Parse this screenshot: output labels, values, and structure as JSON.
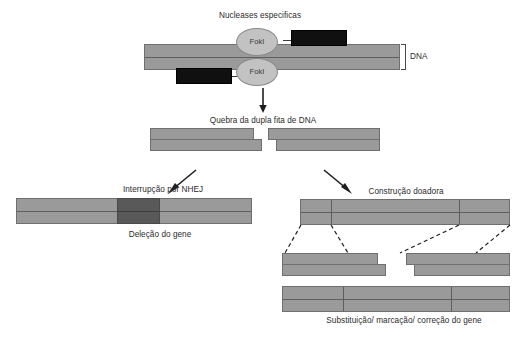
{
  "figure": {
    "title": "Nucleases especificas",
    "background_color": "#ffffff"
  },
  "labels": {
    "nucleases": "Nucleases especificas",
    "fok_top": "FokI",
    "fok_bottom": "FokI",
    "dna": "DNA",
    "double_strand_break": "Quebra da dupla fita de DNA",
    "nhej": "Interrupção por NHEJ",
    "gene_deletion": "Deleção do gene",
    "donor_construct": "Construção doadora",
    "gene_replacement": "Substituição/ marcação/ correção do gene"
  },
  "colors": {
    "dna_fill": "#9a9a9a",
    "dna_stroke": "#6f6f6f",
    "dna_midline": "#5e5e5e",
    "fok_fill": "#c2c2c2",
    "fok_stroke": "#8a8a8a",
    "zinc_finger_fill": "#101010",
    "deletion_fill": "#595959",
    "text": "#2b2b2b"
  },
  "stages": [
    {
      "id": "stage-1-nuclease-binding",
      "caption": "Nucleases especificas",
      "description": "Two FokI nuclease domains with zinc-finger DNA binding domains bound to a DNA duplex"
    },
    {
      "id": "stage-2-double-strand-break",
      "caption": "Quebra da dupla fita de DNA",
      "description": "DNA duplex cleaved into two fragments with staggered sticky ends"
    },
    {
      "id": "stage-3a-nhej",
      "caption": "Interrupção por NHEJ",
      "result": "Deleção do gene",
      "description": "Non-homologous end joining produces a gene deletion shown as a dark block"
    },
    {
      "id": "stage-3b-donor",
      "caption": "Construção doadora",
      "result": "Substituição/ marcação/ correção do gene",
      "description": "Donor construct with homology arms recombines into the break site"
    }
  ]
}
